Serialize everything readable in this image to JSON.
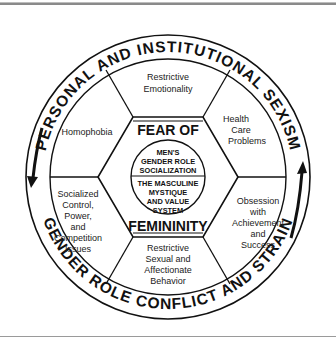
{
  "diagram": {
    "outer_ring": {
      "top_text": "PERSONAL AND INSTITUTIONAL SEXISM",
      "bottom_text": "GENDER ROLE CONFLICT AND STRAIN"
    },
    "segments": {
      "top": [
        "Restrictive",
        "Emotionality"
      ],
      "top_right": [
        "Health",
        "Care",
        "Problems"
      ],
      "bottom_right": [
        "Obsession",
        "with",
        "Achievement",
        "and",
        "Success"
      ],
      "bottom": [
        "Restrictive",
        "Sexual and",
        "Affectionate",
        "Behavior"
      ],
      "bottom_left": [
        "Socialized",
        "Control,",
        "Power,",
        "and",
        "Competition",
        "Issues"
      ],
      "top_left": [
        "Homophobia"
      ]
    },
    "hexagon": {
      "top_label": "FEAR OF",
      "bottom_label": "FEMININITY"
    },
    "core": {
      "upper": [
        "MEN'S",
        "GENDER ROLE",
        "SOCIALIZATION"
      ],
      "lower": [
        "THE MASCULINE",
        "MYSTIQUE",
        "AND VALUE",
        "SYSTEM"
      ]
    },
    "arrows": {
      "left": "down-arrow",
      "right": "up-arrow"
    },
    "colors": {
      "ink": "#111111",
      "background": "#ffffff"
    }
  }
}
